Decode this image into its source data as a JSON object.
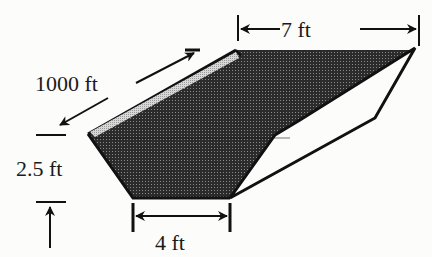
{
  "diagram": {
    "type": "trapezoidal channel (canal) cross-section in perspective",
    "labels": {
      "length": "1000 ft",
      "top_width": "7 ft",
      "depth": "2.5 ft",
      "bottom_width": "4 ft"
    },
    "colors": {
      "fill_dark": "#2b2b2b",
      "stipple": "#8a8a8a",
      "ridge": "#c8c8c8",
      "line": "#111111",
      "background": "#fcfcfb"
    }
  }
}
